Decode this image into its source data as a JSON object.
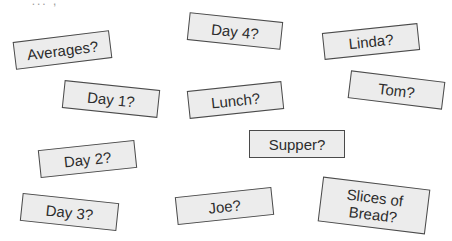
{
  "top_fragment": "' ... ,",
  "cards": [
    {
      "id": "averages",
      "label": "Averages?"
    },
    {
      "id": "day4",
      "label": "Day 4?"
    },
    {
      "id": "linda",
      "label": "Linda?"
    },
    {
      "id": "day1",
      "label": "Day 1?"
    },
    {
      "id": "lunch",
      "label": "Lunch?"
    },
    {
      "id": "tom",
      "label": "Tom?"
    },
    {
      "id": "supper",
      "label": "Supper?"
    },
    {
      "id": "day2",
      "label": "Day 2?"
    },
    {
      "id": "day3",
      "label": "Day 3?"
    },
    {
      "id": "joe",
      "label": "Joe?"
    },
    {
      "id": "slices",
      "label": "Slices of Bread?"
    }
  ],
  "colors": {
    "card_fill": "#ececec",
    "card_border": "#4a4a4a",
    "text": "#2c2c2c"
  }
}
